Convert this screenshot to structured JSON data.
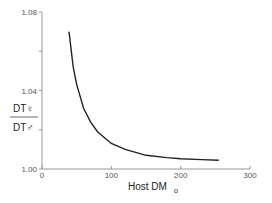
{
  "chart_data": {
    "type": "line",
    "title": "",
    "xlabel": "Host DM",
    "xlabel_subscript": "o",
    "ylabel_numerator": "DT♀",
    "ylabel_denominator": "DT♂",
    "xlim": [
      0,
      300
    ],
    "ylim": [
      1.0,
      1.08
    ],
    "x_ticks": [
      "0",
      "100",
      "200",
      "300"
    ],
    "y_ticks": [
      "1.00",
      "1.04",
      "1.08"
    ],
    "grid": false,
    "legend": null,
    "series": [
      {
        "name": "DT ratio",
        "x": [
          39,
          45,
          50,
          60,
          70,
          80,
          100,
          120,
          150,
          180,
          200,
          230,
          255
        ],
        "y": [
          1.07,
          1.052,
          1.043,
          1.031,
          1.024,
          1.019,
          1.013,
          1.01,
          1.007,
          1.0058,
          1.0052,
          1.0048,
          1.0045
        ]
      }
    ]
  }
}
